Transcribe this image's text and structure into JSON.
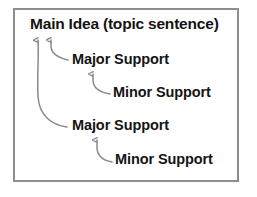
{
  "diagram": {
    "frame": {
      "border_color": "#8e8e8e",
      "background_color": "#ffffff"
    },
    "text_color": "#141414",
    "arrow_color": "#8a8a8a",
    "nodes": [
      {
        "id": "main-idea",
        "label": "Main Idea (topic sentence)",
        "level": 0
      },
      {
        "id": "major-support-1",
        "label": "Major Support",
        "level": 1
      },
      {
        "id": "minor-support-1",
        "label": "Minor Support",
        "level": 2
      },
      {
        "id": "major-support-2",
        "label": "Major Support",
        "level": 1
      },
      {
        "id": "minor-support-2",
        "label": "Minor Support",
        "level": 2
      }
    ],
    "arrows": [
      {
        "id": "arrow-major1-to-main",
        "from": "major-support-1",
        "to": "main-idea",
        "style": "curved-up"
      },
      {
        "id": "arrow-major2-to-main",
        "from": "major-support-2",
        "to": "main-idea",
        "style": "curved-up-long"
      },
      {
        "id": "arrow-minor1-to-major1",
        "from": "minor-support-1",
        "to": "major-support-1",
        "style": "curved-up"
      },
      {
        "id": "arrow-minor2-to-major2",
        "from": "minor-support-2",
        "to": "major-support-2",
        "style": "curved-up"
      }
    ]
  }
}
